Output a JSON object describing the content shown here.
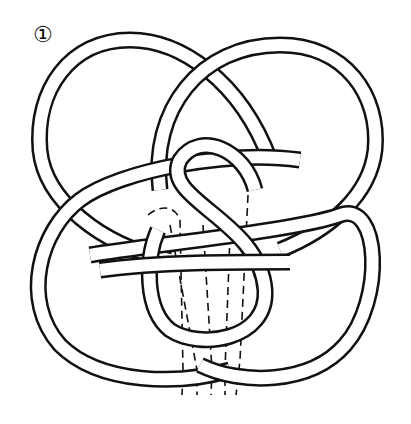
{
  "diagram": {
    "step_label": "①",
    "colors": {
      "line": "#111111",
      "fill": "#ffffff"
    }
  }
}
